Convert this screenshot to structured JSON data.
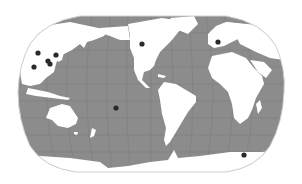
{
  "map": {
    "projection": "robinson-like",
    "central_meridian_label": "Pacific/Americas centered",
    "colors": {
      "background": "#ffffff",
      "ocean": "#8c8c8c",
      "land": "#ffffff",
      "graticule": "#7a7a7a",
      "outline": "#d0d0d0",
      "marker": "#2a2a2a"
    },
    "markers": [
      {
        "id": "asia-1",
        "region": "East Asia",
        "x": 38,
        "y": 53
      },
      {
        "id": "asia-2",
        "region": "East Asia",
        "x": 56,
        "y": 55
      },
      {
        "id": "asia-3",
        "region": "East Asia",
        "x": 48,
        "y": 61
      },
      {
        "id": "asia-4",
        "region": "East Asia",
        "x": 50,
        "y": 64
      },
      {
        "id": "asia-5",
        "region": "East Asia",
        "x": 34,
        "y": 67
      },
      {
        "id": "north-america-1",
        "region": "North America",
        "x": 142,
        "y": 44
      },
      {
        "id": "europe-1",
        "region": "Europe",
        "x": 218,
        "y": 42
      },
      {
        "id": "pacific-1",
        "region": "South Pacific",
        "x": 116,
        "y": 108
      },
      {
        "id": "southern-ocean-1",
        "region": "Southern Ocean",
        "x": 244,
        "y": 155
      }
    ]
  }
}
